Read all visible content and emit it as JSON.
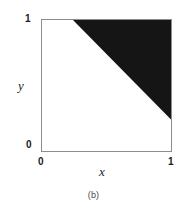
{
  "figure": {
    "caption": "(b)",
    "background_color": "#ffffff"
  },
  "chart_data": {
    "type": "area",
    "title": "",
    "subtitle": "",
    "xlabel": "x",
    "ylabel": "y",
    "xlim": [
      0,
      1
    ],
    "ylim": [
      0,
      1
    ],
    "xticks": [
      0,
      1
    ],
    "xticklabels": [
      "0",
      "1"
    ],
    "yticks": [
      0,
      1
    ],
    "yticklabels": [
      "0",
      "1"
    ],
    "grid": false,
    "legend": null,
    "frame_color": "#8d8d8d",
    "shaded_color": "#151515",
    "unshaded_color": "#ffffff",
    "region": {
      "name": "shaded-triangle",
      "fill": "#151515",
      "boundary_line": {
        "point_a": [
          0.24,
          1.0
        ],
        "point_b": [
          1.0,
          0.24
        ],
        "slope": -1.0,
        "intercept": 1.24,
        "inequality": "x + y >= 1.24"
      },
      "polygon_points": [
        [
          0.24,
          1.0
        ],
        [
          1.0,
          1.0
        ],
        [
          1.0,
          0.24
        ]
      ]
    }
  },
  "axes": {
    "x": {
      "title": "x",
      "tick_min_label": "0",
      "tick_max_label": "1"
    },
    "y": {
      "title": "y",
      "tick_min_label": "0",
      "tick_max_label": "1"
    }
  }
}
